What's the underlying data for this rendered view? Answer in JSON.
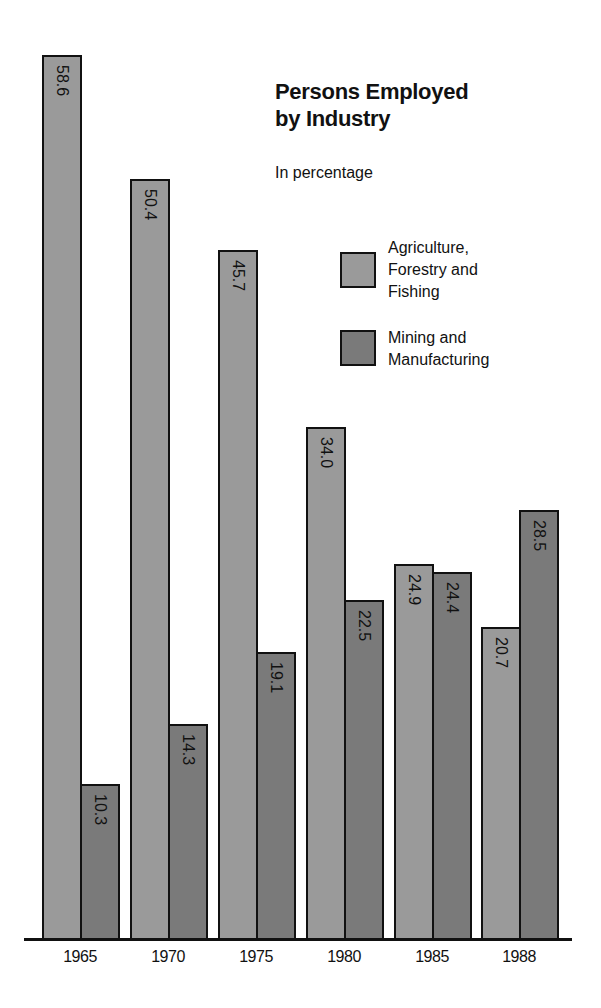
{
  "chart_data": {
    "type": "bar",
    "title": "Persons Employed by Industry",
    "subtitle": "In percentage",
    "xlabel": "",
    "ylabel": "",
    "categories": [
      "1965",
      "1970",
      "1975",
      "1980",
      "1985",
      "1988"
    ],
    "series": [
      {
        "name": "Agriculture, Forestry and Fishing",
        "color": "#9a9a9a",
        "values": [
          58.6,
          50.4,
          45.7,
          34.0,
          24.9,
          20.7
        ]
      },
      {
        "name": "Mining and Manufacturing",
        "color": "#7a7a7a",
        "values": [
          10.3,
          14.3,
          19.1,
          22.5,
          24.4,
          28.5
        ]
      }
    ],
    "value_labels": [
      [
        "58.6",
        "50.4",
        "45.7",
        "34.0",
        "24.9",
        "20.7"
      ],
      [
        "10.3",
        "14.3",
        "19.1",
        "22.5",
        "24.4",
        "28.5"
      ]
    ],
    "grid": false,
    "legend_position": "upper right",
    "ylim": [
      0,
      60
    ]
  },
  "title_line1": "Persons Employed",
  "title_line2": "by Industry",
  "subtitle": "In percentage",
  "legend": [
    {
      "label": "Agriculture,\nForestry and\nFishing",
      "color": "#9a9a9a"
    },
    {
      "label": "Mining and\nManufacturing",
      "color": "#7a7a7a"
    }
  ]
}
